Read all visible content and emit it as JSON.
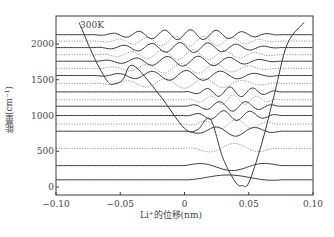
{
  "figure": {
    "temperature_label": "300K",
    "ylabel": "能量(cm⁻¹)",
    "xlabel": "Li⁺的位移(nm)"
  },
  "chart_data": {
    "type": "line",
    "title": "",
    "annotation": "300K",
    "xlabel": "Li⁺的位移(nm)",
    "ylabel": "能量(cm⁻¹)",
    "xlim": [
      -0.1,
      0.1
    ],
    "ylim": [
      -100,
      2300
    ],
    "x_ticks": [
      "-0.10",
      "-0.05",
      "0",
      "0.05",
      "0.10"
    ],
    "y_ticks": [
      "0",
      "500",
      "1000",
      "1500",
      "2000"
    ],
    "grid": false,
    "legend": null,
    "potential": {
      "description": "Asymmetric double-well potential: shallow well near -0.055 nm (~1450 cm-1), deep well near 0.045 nm (~0 cm-1), barrier near 0.02 nm (~950 cm-1)",
      "x": [
        -0.082,
        -0.07,
        -0.06,
        -0.055,
        -0.048,
        -0.04,
        -0.02,
        0.0,
        0.01,
        0.02,
        0.03,
        0.04,
        0.045,
        0.05,
        0.06,
        0.07,
        0.08,
        0.093
      ],
      "y": [
        2300,
        1800,
        1480,
        1440,
        1500,
        1700,
        1300,
        820,
        800,
        950,
        400,
        60,
        20,
        60,
        600,
        1300,
        2000,
        2300
      ]
    },
    "levels": [
      {
        "energy": 100,
        "style": "solid"
      },
      {
        "energy": 300,
        "style": "solid"
      },
      {
        "energy": 540,
        "style": "dotted"
      },
      {
        "energy": 780,
        "style": "solid"
      },
      {
        "energy": 880,
        "style": "dotted"
      },
      {
        "energy": 1000,
        "style": "solid"
      },
      {
        "energy": 1130,
        "style": "solid"
      },
      {
        "energy": 1220,
        "style": "dotted"
      },
      {
        "energy": 1330,
        "style": "solid"
      },
      {
        "energy": 1450,
        "style": "dotted"
      },
      {
        "energy": 1560,
        "style": "solid"
      },
      {
        "energy": 1660,
        "style": "dotted"
      },
      {
        "energy": 1760,
        "style": "solid"
      },
      {
        "energy": 1850,
        "style": "dotted"
      },
      {
        "energy": 1950,
        "style": "solid"
      },
      {
        "energy": 2040,
        "style": "dotted"
      },
      {
        "energy": 2130,
        "style": "solid"
      }
    ]
  },
  "colors": {
    "ink": "#3a3a3a",
    "dotted": "#777777",
    "background": "#ffffff"
  }
}
